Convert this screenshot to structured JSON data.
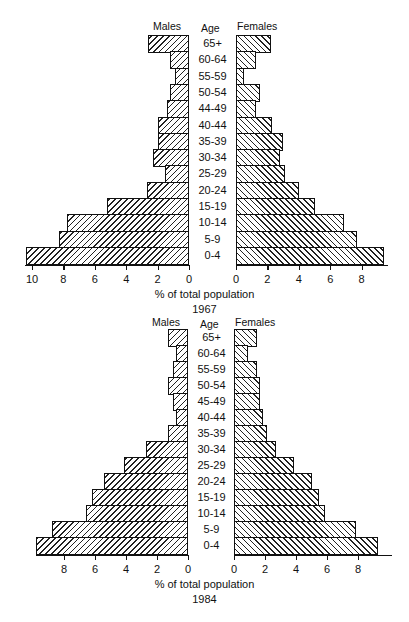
{
  "chart_data": [
    {
      "type": "bar",
      "subtype": "population-pyramid",
      "title": "1967",
      "xlabel": "% of total population",
      "left_header": "Males",
      "center_header": "Age",
      "right_header": "Females",
      "categories": [
        "65+",
        "60-64",
        "55-59",
        "50-54",
        "44-49",
        "40-44",
        "35-39",
        "30-34",
        "25-29",
        "20-24",
        "15-19",
        "10-14",
        "5-9",
        "0-4"
      ],
      "series": [
        {
          "name": "Males",
          "values": [
            2.6,
            1.2,
            0.9,
            1.2,
            1.4,
            2.0,
            2.0,
            2.3,
            1.5,
            2.7,
            5.2,
            7.8,
            8.3,
            10.4
          ]
        },
        {
          "name": "Females",
          "values": [
            2.2,
            1.3,
            0.5,
            1.5,
            1.3,
            2.3,
            3.0,
            2.8,
            3.1,
            4.0,
            5.0,
            6.9,
            7.7,
            9.4
          ]
        }
      ],
      "male_ticks": [
        "10",
        "8",
        "6",
        "4",
        "2",
        "0"
      ],
      "female_ticks": [
        "0",
        "2",
        "4",
        "6",
        "8"
      ],
      "xlim_males": [
        0,
        10.5
      ],
      "xlim_females": [
        0,
        9.5
      ],
      "grid": false
    },
    {
      "type": "bar",
      "subtype": "population-pyramid",
      "title": "1984",
      "xlabel": "% of total population",
      "left_header": "Males",
      "center_header": "Age",
      "right_header": "Females",
      "categories": [
        "65+",
        "60-64",
        "55-59",
        "50-54",
        "45-49",
        "40-44",
        "35-39",
        "30-34",
        "25-29",
        "20-24",
        "15-19",
        "10-14",
        "5-9",
        "0-4"
      ],
      "series": [
        {
          "name": "Males",
          "values": [
            1.3,
            0.8,
            1.0,
            1.3,
            1.0,
            0.8,
            1.3,
            2.7,
            4.1,
            5.4,
            6.2,
            6.6,
            8.8,
            9.8
          ]
        },
        {
          "name": "Females",
          "values": [
            1.5,
            0.9,
            1.5,
            1.7,
            1.7,
            1.9,
            2.1,
            2.7,
            3.9,
            5.0,
            5.5,
            5.9,
            7.9,
            9.3
          ]
        }
      ],
      "male_ticks": [
        "8",
        "6",
        "4",
        "2",
        "0"
      ],
      "female_ticks": [
        "0",
        "2",
        "4",
        "6",
        "8"
      ],
      "xlim_males": [
        0,
        10
      ],
      "xlim_females": [
        0,
        9.5
      ],
      "grid": false
    }
  ],
  "layout": [
    {
      "top": 0,
      "header_y": 20,
      "rows_top": 35,
      "row_h": 16.3,
      "male_zero": 189,
      "female_zero": 236,
      "px_per_unit": 15.7,
      "axis_left": 25,
      "axis_right": 388
    },
    {
      "top": 0,
      "header_y": 316,
      "rows_top": 329,
      "row_h": 16.0,
      "male_zero": 188,
      "female_zero": 234,
      "px_per_unit": 15.5,
      "axis_left": 36,
      "axis_right": 392
    }
  ]
}
